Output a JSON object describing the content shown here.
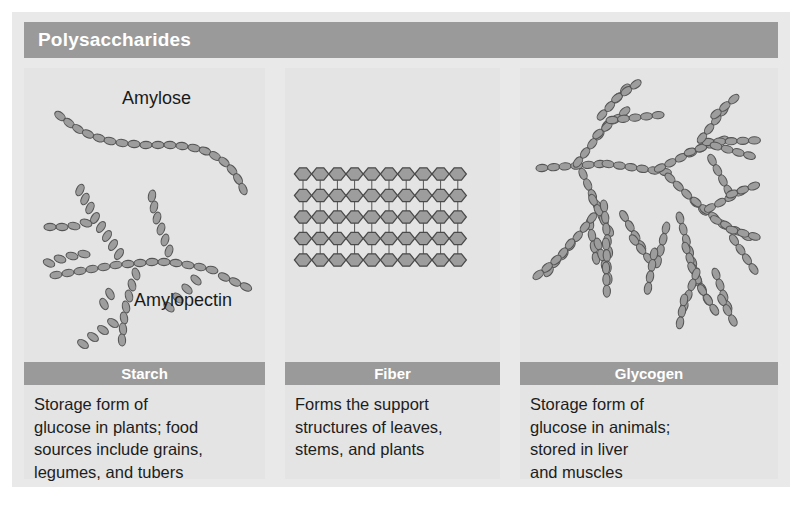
{
  "figure": {
    "header": {
      "title": "Polysaccharides"
    },
    "colors": {
      "bar": "#9a9a9a",
      "panel_bg": "#e4e4e4",
      "card_bg": "#e9e9e9",
      "molecule_fill": "#9d9d9d",
      "molecule_stroke": "#555555",
      "text": "#1d1d1d",
      "bar_text": "#ffffff"
    },
    "panels": [
      {
        "id": "starch",
        "label": "Starch",
        "description": "Storage form of\nglucose in plants; food\nsources include grains,\nlegumes, and tubers",
        "molecule_labels": [
          "Amylose",
          "Amylopectin"
        ],
        "diagram": "unbranched-chain-and-branched-chain"
      },
      {
        "id": "fiber",
        "label": "Fiber",
        "description": "Forms the support\nstructures of leaves,\nstems, and plants",
        "molecule_labels": [],
        "diagram": "cross-linked-grid",
        "grid": {
          "columns": 10,
          "rows": 5
        }
      },
      {
        "id": "glycogen",
        "label": "Glycogen",
        "description": "Storage form of\nglucose in animals;\nstored in liver\nand muscles",
        "molecule_labels": [],
        "diagram": "highly-branched-chain"
      }
    ]
  }
}
